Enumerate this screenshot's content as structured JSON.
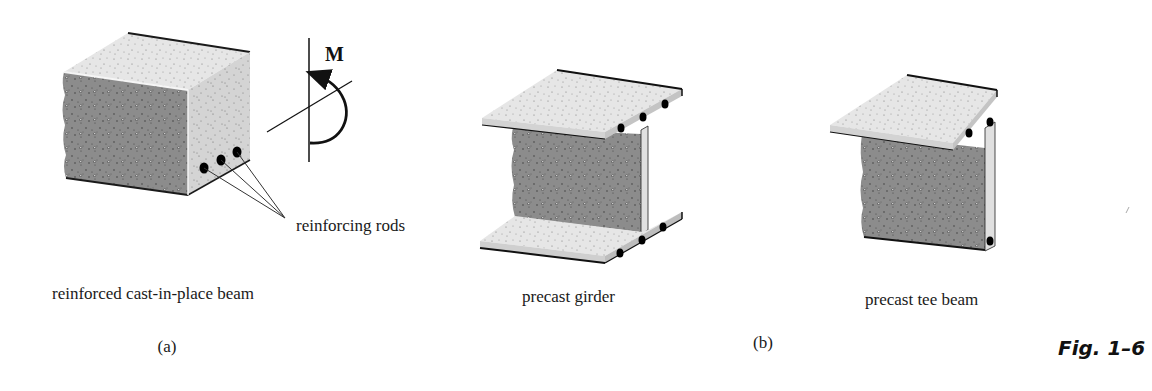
{
  "figure": {
    "number": "Fig. 1–6",
    "panels": [
      {
        "id": "a",
        "sublabel": "(a)",
        "items": [
          {
            "caption": "reinforced cast-in-place beam",
            "shape": "rectangular-block"
          }
        ],
        "annotations": {
          "moment_label": "M",
          "callout": "reinforcing rods"
        }
      },
      {
        "id": "b",
        "sublabel": "(b)",
        "items": [
          {
            "caption": "precast girder",
            "shape": "i-section"
          },
          {
            "caption": "precast tee beam",
            "shape": "t-section"
          }
        ]
      }
    ]
  },
  "colors": {
    "concrete_light": "#e8e8e8",
    "concrete_side": "#d6d6d6",
    "concrete_dark": "#8a8a8a",
    "edge": "#1a1a1a",
    "rod": "#000000"
  }
}
